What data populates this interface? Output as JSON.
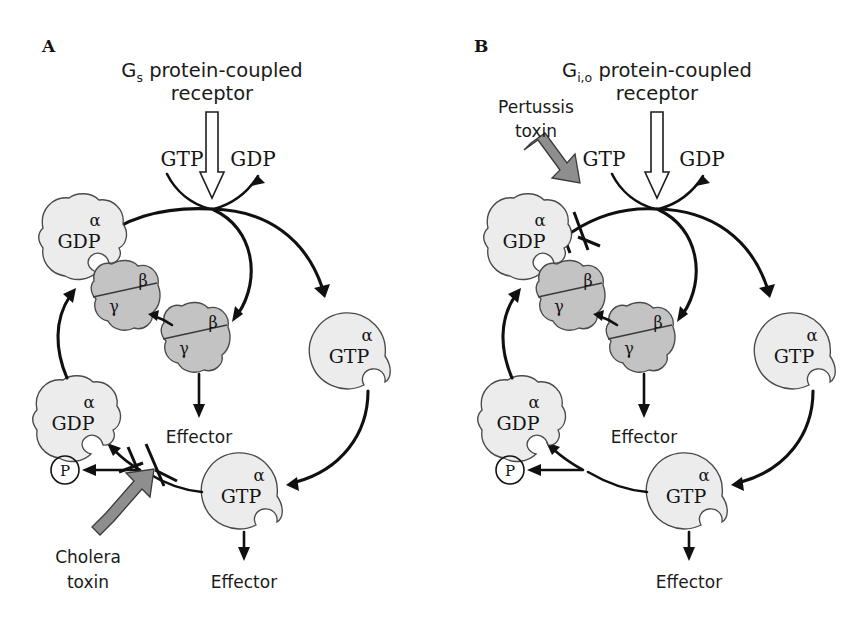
{
  "figure": {
    "type": "diagram",
    "background_color": "#ffffff",
    "colors": {
      "alpha_subunit_fill": "#ececec",
      "beta_gamma_fill": "#c3c3c3",
      "toxin_arrow_fill": "#8e8e8e",
      "outline": "#4a4a4a",
      "arrow_stroke": "#101010"
    }
  },
  "panels": [
    {
      "letter": "A",
      "title_line1_prefix": "G",
      "title_line1_subscript": "s",
      "title_line1_rest": " protein-coupled",
      "title_line2": "receptor",
      "nucleotide_in": "GTP",
      "nucleotide_out": "GDP",
      "alpha_gdp_top": {
        "greek": "α",
        "nucleotide": "GDP"
      },
      "alpha_gdp_left": {
        "greek": "α",
        "nucleotide": "GDP"
      },
      "alpha_gtp_right": {
        "greek": "α",
        "nucleotide": "GTP"
      },
      "alpha_gtp_bottom": {
        "greek": "α",
        "nucleotide": "GTP"
      },
      "betagamma_upper": {
        "beta": "β",
        "gamma": "γ"
      },
      "betagamma_lower": {
        "beta": "β",
        "gamma": "γ"
      },
      "effector_upper": "Effector",
      "effector_lower": "Effector",
      "phosphate": "P",
      "toxin_line1": "Cholera",
      "toxin_line2": "toxin",
      "toxin_blocks": "GTP hydrolysis by alpha-GTP",
      "has_block_bar": true
    },
    {
      "letter": "B",
      "title_line1_prefix": "G",
      "title_line1_subscript": "i,o",
      "title_line1_rest": " protein-coupled",
      "title_line2": "receptor",
      "nucleotide_in": "GTP",
      "nucleotide_out": "GDP",
      "alpha_gdp_top": {
        "greek": "α",
        "nucleotide": "GDP"
      },
      "alpha_gdp_left": {
        "greek": "α",
        "nucleotide": "GDP"
      },
      "alpha_gtp_right": {
        "greek": "α",
        "nucleotide": "GTP"
      },
      "alpha_gtp_bottom": {
        "greek": "α",
        "nucleotide": "GTP"
      },
      "betagamma_upper": {
        "beta": "β",
        "gamma": "γ"
      },
      "betagamma_lower": {
        "beta": "β",
        "gamma": "γ"
      },
      "effector_upper": "Effector",
      "effector_lower": "Effector",
      "phosphate": "P",
      "toxin_line1": "Pertussis",
      "toxin_line2": "toxin",
      "toxin_blocks": "receptor-mediated GDP/GTP exchange on alpha-GDP",
      "has_block_bar": true
    }
  ]
}
